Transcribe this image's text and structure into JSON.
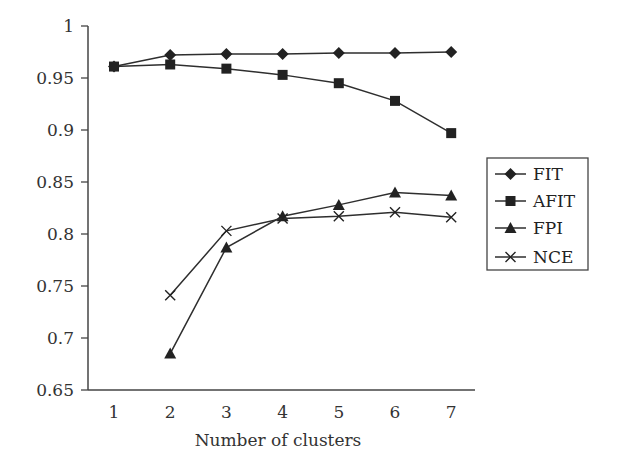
{
  "chart_data": {
    "type": "line",
    "title": "",
    "xlabel": "Number of clusters",
    "ylabel": "",
    "x": [
      1,
      2,
      3,
      4,
      5,
      6,
      7
    ],
    "xticks": [
      "1",
      "2",
      "3",
      "4",
      "5",
      "6",
      "7"
    ],
    "ylim": [
      0.65,
      1.0
    ],
    "yticks": [
      "0.65",
      "0.7",
      "0.75",
      "0.8",
      "0.85",
      "0.9",
      "0.95",
      "1"
    ],
    "grid": false,
    "legend_position": "right",
    "series": [
      {
        "name": "FIT",
        "marker": "diamond",
        "values": [
          0.961,
          0.972,
          0.973,
          0.973,
          0.974,
          0.974,
          0.975
        ]
      },
      {
        "name": "AFIT",
        "marker": "square",
        "values": [
          0.961,
          0.963,
          0.959,
          0.953,
          0.945,
          0.928,
          0.897
        ]
      },
      {
        "name": "FPI",
        "marker": "triangle",
        "values": [
          null,
          0.685,
          0.787,
          0.817,
          0.828,
          0.84,
          0.837
        ]
      },
      {
        "name": "NCE",
        "marker": "x",
        "values": [
          null,
          0.741,
          0.803,
          0.815,
          0.817,
          0.821,
          0.816
        ]
      }
    ]
  },
  "colors": {
    "line": "#2e2e2e",
    "marker": "#222222",
    "axis": "#444444"
  }
}
